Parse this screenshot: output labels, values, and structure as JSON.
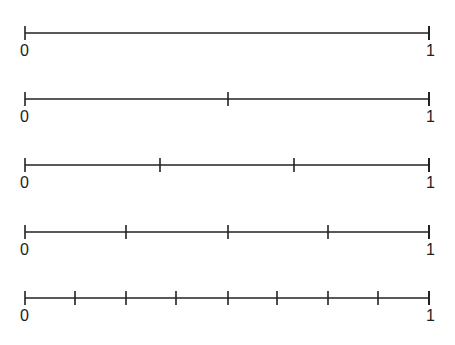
{
  "diagram": {
    "type": "number-lines",
    "color": "#222222",
    "line_start_x": 25,
    "line_end_x": 429,
    "start_label": "0",
    "end_label": "1",
    "lines": [
      {
        "y": 33,
        "divisions": 1,
        "ticks": []
      },
      {
        "y": 99,
        "divisions": 2,
        "ticks": [
          228
        ]
      },
      {
        "y": 165,
        "divisions": 3,
        "ticks": [
          160,
          294
        ]
      },
      {
        "y": 232,
        "divisions": 4,
        "ticks": [
          126,
          228,
          328
        ]
      },
      {
        "y": 298,
        "divisions": 8,
        "ticks": [
          75,
          126,
          176,
          228,
          277,
          328,
          378
        ]
      }
    ]
  }
}
